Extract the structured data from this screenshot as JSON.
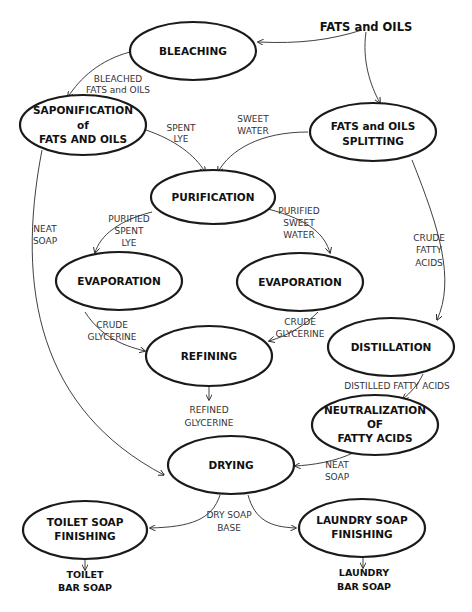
{
  "diagram": {
    "source": {
      "id": "fats-oils",
      "lines": [
        "FATS and OILS"
      ]
    },
    "nodes": [
      {
        "id": "bleaching",
        "lines": [
          "BLEACHING"
        ]
      },
      {
        "id": "saponification",
        "lines": [
          "SAPONIFICATION",
          "of",
          "FATS AND OILS"
        ]
      },
      {
        "id": "splitting",
        "lines": [
          "FATS and OILS",
          "SPLITTING"
        ]
      },
      {
        "id": "purification",
        "lines": [
          "PURIFICATION"
        ]
      },
      {
        "id": "evaporation-left",
        "lines": [
          "EVAPORATION"
        ]
      },
      {
        "id": "evaporation-right",
        "lines": [
          "EVAPORATION"
        ]
      },
      {
        "id": "refining",
        "lines": [
          "REFINING"
        ]
      },
      {
        "id": "distillation",
        "lines": [
          "DISTILLATION"
        ]
      },
      {
        "id": "neutralization",
        "lines": [
          "NEUTRALIZATION",
          "OF",
          "FATTY ACIDS"
        ]
      },
      {
        "id": "drying",
        "lines": [
          "DRYING"
        ]
      },
      {
        "id": "toilet-finishing",
        "lines": [
          "TOILET SOAP",
          "FINISHING"
        ]
      },
      {
        "id": "laundry-finishing",
        "lines": [
          "LAUNDRY SOAP",
          "FINISHING"
        ]
      }
    ],
    "edge_labels": {
      "bleached": [
        "BLEACHED",
        "FATS and OILS"
      ],
      "spent_lye": [
        "SPENT",
        "LYE"
      ],
      "sweet_water": [
        "SWEET",
        "WATER"
      ],
      "neat_soap_left": [
        "NEAT",
        "SOAP"
      ],
      "purified_spent_lye": [
        "PURIFIED",
        "SPENT",
        "LYE"
      ],
      "purified_sweet_water": [
        "PURIFIED",
        "SWEET",
        "WATER"
      ],
      "crude_fatty_acids": [
        "CRUDE",
        "FATTY",
        "ACIDS"
      ],
      "crude_glycerine_left": [
        "CRUDE",
        "GLYCERINE"
      ],
      "crude_glycerine_right": [
        "CRUDE",
        "GLYCERINE"
      ],
      "distilled_fatty_acids": [
        "DISTILLED FATTY ACIDS"
      ],
      "refined_glycerine": [
        "REFINED",
        "GLYCERINE"
      ],
      "neat_soap_right": [
        "NEAT",
        "SOAP"
      ],
      "dry_soap_base": [
        "DRY SOAP",
        "BASE"
      ]
    },
    "products": {
      "toilet": [
        "TOILET",
        "BAR SOAP"
      ],
      "laundry": [
        "LAUNDRY",
        "BAR SOAP"
      ]
    },
    "colors": {
      "stroke": "#1a1a1a",
      "text": "#111111",
      "edge": "#2a2a2a",
      "background": "#ffffff"
    }
  }
}
